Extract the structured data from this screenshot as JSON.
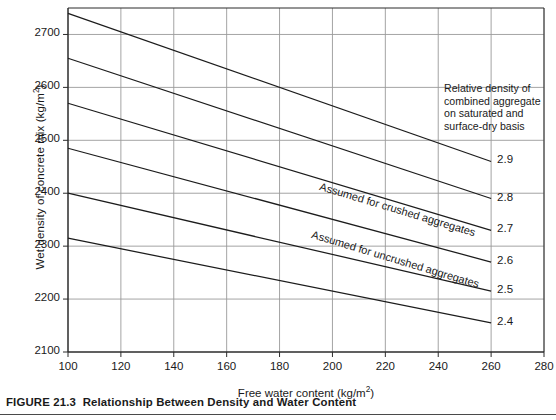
{
  "figure": {
    "caption_prefix": "FIGURE 21.3",
    "caption_text": "Relationship Between Density and Water Content"
  },
  "annotation": {
    "lines": [
      "Relative density  of",
      "combined aggregate",
      "on saturated and",
      "surface-dry basis"
    ]
  },
  "curve_labels": [
    {
      "text": "Assumed for crushed aggregates"
    },
    {
      "text": "Assumed for uncrushed aggregates"
    }
  ],
  "chart_data": {
    "type": "line",
    "title": "Relationship Between Density and Water Content",
    "xlabel": "Free water content (kg/m²)",
    "ylabel": "Wet density of concrete mix (kg/m²)",
    "xlim": [
      100,
      280
    ],
    "ylim": [
      2100,
      2750
    ],
    "xticks": [
      100,
      120,
      140,
      160,
      180,
      200,
      220,
      240,
      260,
      280
    ],
    "yticks": [
      2100,
      2200,
      2300,
      2400,
      2500,
      2600,
      2700
    ],
    "xtick_labels": [
      "100",
      "120",
      "140",
      "160",
      "180",
      "200",
      "220",
      "240",
      "260",
      "280"
    ],
    "ytick_labels": [
      "2100",
      "2200",
      "2300",
      "2400",
      "2500",
      "2600",
      "2700"
    ],
    "grid": true,
    "legend": "none",
    "annotations": [
      {
        "text": "Relative density  of combined aggregate on saturated and surface-dry basis",
        "x": 242,
        "y": 2610
      },
      {
        "text": "Assumed for crushed aggregates",
        "x": 195,
        "y": 2430
      },
      {
        "text": "Assumed for uncrushed aggregates",
        "x": 195,
        "y": 2345
      }
    ],
    "series": [
      {
        "name": "2.9",
        "label": "2.9",
        "x": [
          100,
          260
        ],
        "y": [
          2740,
          2460
        ]
      },
      {
        "name": "2.8",
        "label": "2.8",
        "x": [
          100,
          260
        ],
        "y": [
          2655,
          2390
        ]
      },
      {
        "name": "2.7",
        "label": "2.7",
        "x": [
          100,
          260
        ],
        "y": [
          2570,
          2330
        ]
      },
      {
        "name": "2.6",
        "label": "2.6",
        "x": [
          100,
          260
        ],
        "y": [
          2485,
          2270
        ]
      },
      {
        "name": "2.5",
        "label": "2.5",
        "x": [
          100,
          260
        ],
        "y": [
          2400,
          2215
        ]
      },
      {
        "name": "2.4",
        "label": "2.4",
        "x": [
          100,
          260
        ],
        "y": [
          2315,
          2155
        ]
      }
    ],
    "colors": {
      "line": "#1c1c1c",
      "grid": "#9a9a9a",
      "axis": "#2b2b2b",
      "background": "#ffffff"
    }
  }
}
